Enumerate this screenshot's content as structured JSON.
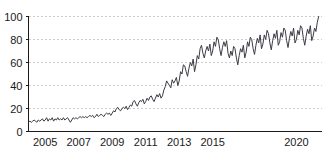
{
  "chart_data": {
    "type": "line",
    "title": "",
    "subtitle": "",
    "xlabel": "",
    "ylabel": "",
    "xlim": [
      2004.0,
      2021.5
    ],
    "ylim": [
      0,
      100
    ],
    "grid": true,
    "legend": "none",
    "line_color": "#3c3c46",
    "grid_color": "#bfbfbf",
    "axis_color": "#1a1a1a",
    "background_color": "#ffffff",
    "y_ticks": [
      0,
      20,
      40,
      60,
      80,
      100
    ],
    "y_tick_labels": [
      "0",
      "20",
      "40",
      "60",
      "80",
      "100"
    ],
    "x_ticks": [
      2005,
      2007,
      2009,
      2011,
      2013,
      2015,
      2020
    ],
    "x_tick_labels": [
      "2005",
      "2007",
      "2009",
      "2011",
      "2013",
      "2015",
      "2020"
    ],
    "series": [
      {
        "name": "interest",
        "x": [
          2004.0,
          2004.083,
          2004.167,
          2004.25,
          2004.333,
          2004.417,
          2004.5,
          2004.583,
          2004.667,
          2004.75,
          2004.833,
          2004.917,
          2005.0,
          2005.083,
          2005.167,
          2005.25,
          2005.333,
          2005.417,
          2005.5,
          2005.583,
          2005.667,
          2005.75,
          2005.833,
          2005.917,
          2006.0,
          2006.083,
          2006.167,
          2006.25,
          2006.333,
          2006.417,
          2006.5,
          2006.583,
          2006.667,
          2006.75,
          2006.833,
          2006.917,
          2007.0,
          2007.083,
          2007.167,
          2007.25,
          2007.333,
          2007.417,
          2007.5,
          2007.583,
          2007.667,
          2007.75,
          2007.833,
          2007.917,
          2008.0,
          2008.083,
          2008.167,
          2008.25,
          2008.333,
          2008.417,
          2008.5,
          2008.583,
          2008.667,
          2008.75,
          2008.833,
          2008.917,
          2009.0,
          2009.083,
          2009.167,
          2009.25,
          2009.333,
          2009.417,
          2009.5,
          2009.583,
          2009.667,
          2009.75,
          2009.833,
          2009.917,
          2010.0,
          2010.083,
          2010.167,
          2010.25,
          2010.333,
          2010.417,
          2010.5,
          2010.583,
          2010.667,
          2010.75,
          2010.833,
          2010.917,
          2011.0,
          2011.083,
          2011.167,
          2011.25,
          2011.333,
          2011.417,
          2011.5,
          2011.583,
          2011.667,
          2011.75,
          2011.833,
          2011.917,
          2012.0,
          2012.083,
          2012.167,
          2012.25,
          2012.333,
          2012.417,
          2012.5,
          2012.583,
          2012.667,
          2012.75,
          2012.833,
          2012.917,
          2013.0,
          2013.083,
          2013.167,
          2013.25,
          2013.333,
          2013.417,
          2013.5,
          2013.583,
          2013.667,
          2013.75,
          2013.833,
          2013.917,
          2014.0,
          2014.083,
          2014.167,
          2014.25,
          2014.333,
          2014.417,
          2014.5,
          2014.583,
          2014.667,
          2014.75,
          2014.833,
          2014.917,
          2015.0,
          2015.083,
          2015.167,
          2015.25,
          2015.333,
          2015.417,
          2015.5,
          2015.583,
          2015.667,
          2015.75,
          2015.833,
          2015.917,
          2016.0,
          2016.083,
          2016.167,
          2016.25,
          2016.333,
          2016.417,
          2016.5,
          2016.583,
          2016.667,
          2016.75,
          2016.833,
          2016.917,
          2017.0,
          2017.083,
          2017.167,
          2017.25,
          2017.333,
          2017.417,
          2017.5,
          2017.583,
          2017.667,
          2017.75,
          2017.833,
          2017.917,
          2018.0,
          2018.083,
          2018.167,
          2018.25,
          2018.333,
          2018.417,
          2018.5,
          2018.583,
          2018.667,
          2018.75,
          2018.833,
          2018.917,
          2019.0,
          2019.083,
          2019.167,
          2019.25,
          2019.333,
          2019.417,
          2019.5,
          2019.583,
          2019.667,
          2019.75,
          2019.833,
          2019.917,
          2020.0,
          2020.083,
          2020.167,
          2020.25,
          2020.333,
          2020.417,
          2020.5,
          2020.583,
          2020.667,
          2020.75,
          2020.833,
          2020.917,
          2021.0,
          2021.083,
          2021.167,
          2021.25,
          2021.333
        ],
        "values": [
          8,
          9,
          8,
          9,
          10,
          9,
          8,
          10,
          9,
          10,
          11,
          9,
          10,
          12,
          9,
          11,
          10,
          12,
          9,
          11,
          10,
          12,
          10,
          11,
          10,
          12,
          10,
          11,
          12,
          10,
          8,
          10,
          12,
          11,
          12,
          11,
          12,
          13,
          12,
          13,
          12,
          13,
          12,
          13,
          14,
          13,
          14,
          12,
          13,
          15,
          13,
          14,
          15,
          14,
          13,
          15,
          16,
          15,
          16,
          14,
          16,
          18,
          17,
          20,
          21,
          19,
          18,
          20,
          21,
          20,
          22,
          19,
          21,
          23,
          22,
          26,
          27,
          24,
          22,
          25,
          27,
          26,
          28,
          24,
          26,
          29,
          27,
          30,
          31,
          28,
          26,
          29,
          32,
          30,
          33,
          29,
          31,
          36,
          39,
          44,
          42,
          40,
          38,
          45,
          42,
          44,
          47,
          40,
          44,
          52,
          50,
          58,
          57,
          52,
          48,
          55,
          60,
          57,
          63,
          52,
          58,
          66,
          63,
          72,
          75,
          68,
          64,
          70,
          74,
          70,
          76,
          66,
          70,
          78,
          74,
          82,
          80,
          72,
          66,
          73,
          78,
          74,
          79,
          68,
          64,
          70,
          66,
          74,
          72,
          64,
          58,
          66,
          72,
          69,
          75,
          64,
          69,
          78,
          74,
          82,
          80,
          72,
          67,
          75,
          81,
          77,
          84,
          72,
          76,
          84,
          80,
          88,
          85,
          77,
          71,
          79,
          85,
          81,
          88,
          75,
          78,
          86,
          82,
          90,
          88,
          79,
          73,
          81,
          87,
          83,
          90,
          77,
          80,
          88,
          84,
          92,
          90,
          81,
          75,
          83,
          89,
          85,
          92,
          79,
          83,
          90,
          87,
          95,
          100
        ]
      }
    ]
  }
}
